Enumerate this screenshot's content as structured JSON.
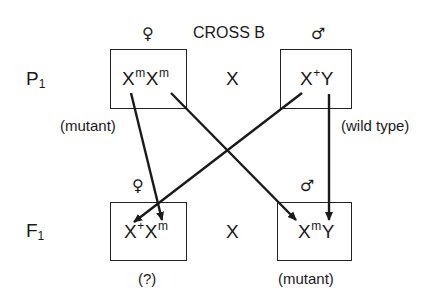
{
  "title": "CROSS B",
  "cross_symbol": "X",
  "generations": [
    {
      "label": "P",
      "subscript": "1",
      "female": {
        "symbol": "♀",
        "genotype": [
          {
            "base": "X",
            "sup": "m"
          },
          {
            "base": "X",
            "sup": "m"
          }
        ],
        "phenotype": "(mutant)"
      },
      "male": {
        "symbol": "♂",
        "genotype": [
          {
            "base": "X",
            "sup": "+"
          },
          {
            "base": "Y",
            "sup": ""
          }
        ],
        "phenotype": "(wild type)"
      }
    },
    {
      "label": "F",
      "subscript": "1",
      "female": {
        "symbol": "♀",
        "genotype": [
          {
            "base": "X",
            "sup": "+"
          },
          {
            "base": "X",
            "sup": "m"
          }
        ],
        "phenotype": "(?)"
      },
      "male": {
        "symbol": "♂",
        "genotype": [
          {
            "base": "X",
            "sup": "m"
          },
          {
            "base": "Y",
            "sup": ""
          }
        ],
        "phenotype": "(mutant)"
      }
    }
  ],
  "arrows": [
    {
      "from": "P1 female X^m (first)",
      "to": "F1 female X^m"
    },
    {
      "from": "P1 female X^m (second)",
      "to": "F1 male X^m"
    },
    {
      "from": "P1 male X^+",
      "to": "F1 female X^+"
    },
    {
      "from": "P1 male Y",
      "to": "F1 male Y"
    }
  ],
  "colors": {
    "ink": "#1a1a1a",
    "background": "#ffffff"
  }
}
